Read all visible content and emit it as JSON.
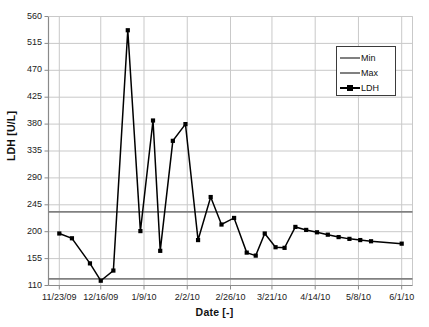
{
  "chart_data": {
    "type": "line",
    "title": "",
    "xlabel": "Date [-]",
    "ylabel": "LDH [U/L]",
    "ylim": [
      110,
      560
    ],
    "ytick_labels": [
      "110",
      "155",
      "200",
      "245",
      "290",
      "335",
      "380",
      "425",
      "470",
      "515",
      "560"
    ],
    "ytick_values": [
      110,
      155,
      200,
      245,
      290,
      335,
      380,
      425,
      470,
      515,
      560
    ],
    "xtick_labels": [
      "11/23/09",
      "12/16/09",
      "1/9/10",
      "2/2/10",
      "2/26/10",
      "3/21/10",
      "4/14/10",
      "5/8/10",
      "6/1/10"
    ],
    "xtick_days": [
      0,
      23,
      47,
      71,
      95,
      118,
      142,
      166,
      190
    ],
    "xlim_days": [
      -6,
      196
    ],
    "grid": true,
    "legend_position": "upper-right",
    "series": [
      {
        "name": "Min",
        "type": "hline",
        "color": "#808080",
        "value": 121
      },
      {
        "name": "Max",
        "type": "hline",
        "color": "#808080",
        "value": 233
      },
      {
        "name": "LDH",
        "type": "line-markers",
        "color": "#000000",
        "marker": "square",
        "x": [
          0,
          7,
          17,
          23,
          30,
          38,
          45,
          52,
          56,
          63,
          70,
          77,
          84,
          90,
          97,
          104,
          109,
          114,
          120,
          125,
          131,
          137,
          143,
          149,
          155,
          161,
          167,
          173,
          190
        ],
        "y": [
          197,
          189,
          147,
          118,
          135,
          537,
          201,
          386,
          168,
          352,
          380,
          186,
          258,
          212,
          223,
          165,
          160,
          197,
          174,
          173,
          208,
          203,
          199,
          195,
          191,
          188,
          186,
          184,
          180
        ]
      }
    ]
  },
  "legend": {
    "items": [
      {
        "label": "Min",
        "kind": "line"
      },
      {
        "label": "Max",
        "kind": "line"
      },
      {
        "label": "LDH",
        "kind": "line-marker"
      }
    ]
  },
  "axes": {
    "y_title": "LDH [U/L]",
    "x_title": "Date [-]"
  }
}
